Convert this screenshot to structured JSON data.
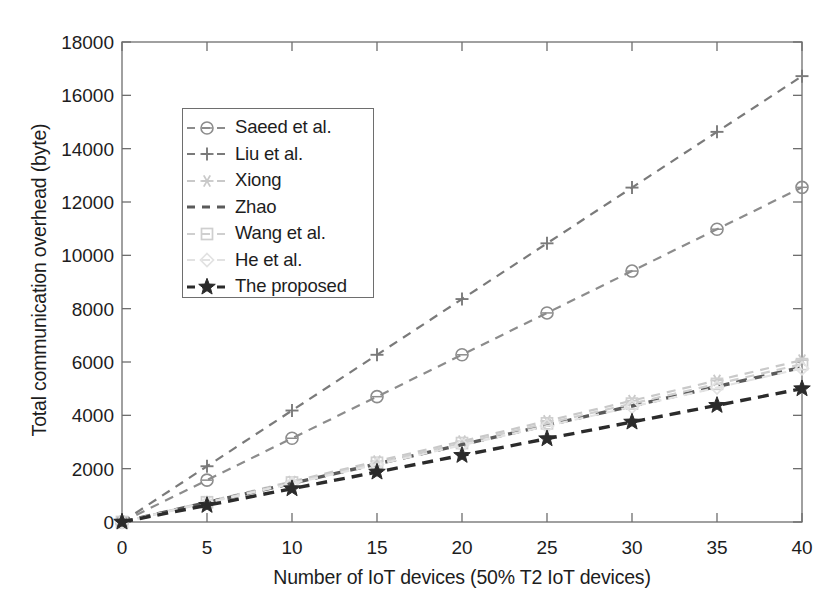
{
  "chart_data": {
    "type": "line",
    "title": "",
    "xlabel": "Number of IoT devices (50% T2 IoT devices)",
    "ylabel": "Total communication overhead (byte)",
    "x": [
      0,
      5,
      10,
      15,
      20,
      25,
      30,
      35,
      40
    ],
    "xlim": [
      0,
      40
    ],
    "ylim": [
      0,
      18000
    ],
    "xticks": [
      0,
      5,
      10,
      15,
      20,
      25,
      30,
      35,
      40
    ],
    "yticks": [
      0,
      2000,
      4000,
      6000,
      8000,
      10000,
      12000,
      14000,
      16000,
      18000
    ],
    "grid": false,
    "legend_position": "upper-left-inside",
    "series": [
      {
        "name": "Saeed et al.",
        "marker": "circle",
        "color": "#8c8c8c",
        "linestyle": "dashed",
        "values": [
          0,
          1570,
          3140,
          4700,
          6270,
          7840,
          9410,
          10980,
          12550
        ]
      },
      {
        "name": "Liu et al.",
        "marker": "plus",
        "color": "#7a7a7a",
        "linestyle": "dashed",
        "values": [
          0,
          2090,
          4180,
          6270,
          8360,
          10450,
          12540,
          14630,
          16720
        ]
      },
      {
        "name": "Xiong",
        "marker": "asterisk",
        "color": "#c9c9c9",
        "linestyle": "dashed",
        "values": [
          0,
          760,
          1520,
          2280,
          3030,
          3790,
          4550,
          5310,
          6070
        ]
      },
      {
        "name": "Zhao",
        "marker": "none",
        "color": "#5a5a5a",
        "linestyle": "dashed",
        "values": [
          0,
          730,
          1450,
          2180,
          2900,
          3630,
          4350,
          5080,
          5800
        ]
      },
      {
        "name": "Wang et al.",
        "marker": "square",
        "color": "#cfcfcf",
        "linestyle": "dashed",
        "values": [
          0,
          740,
          1480,
          2220,
          2960,
          3700,
          4440,
          5180,
          5920
        ]
      },
      {
        "name": "He et al.",
        "marker": "diamond",
        "color": "#e2e2e2",
        "linestyle": "dashed",
        "values": [
          0,
          720,
          1440,
          2160,
          2880,
          3600,
          4320,
          5040,
          5760
        ]
      },
      {
        "name": "The proposed",
        "marker": "star",
        "color": "#2b2b2b",
        "linestyle": "dashed",
        "values": [
          0,
          625,
          1250,
          1875,
          2500,
          3125,
          3750,
          4375,
          5000
        ]
      }
    ]
  },
  "axes": {
    "frame_color": "#6e6e6e",
    "tick_color": "#6e6e6e"
  }
}
